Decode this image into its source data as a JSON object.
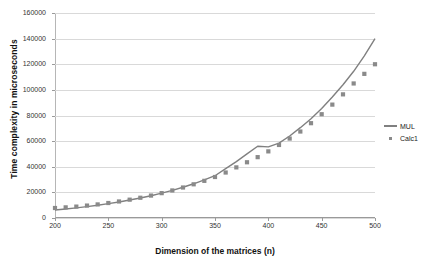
{
  "chart_data": {
    "type": "line",
    "title": "",
    "xlabel": "Dimension of the matrices (n)",
    "ylabel": "Time complexity in microseconds",
    "xlim": [
      200,
      500
    ],
    "ylim": [
      0,
      160000
    ],
    "xticks": [
      200,
      250,
      300,
      350,
      400,
      450,
      500
    ],
    "yticks": [
      0,
      20000,
      40000,
      60000,
      80000,
      100000,
      120000,
      140000,
      160000
    ],
    "grid": "horizontal",
    "legend_position": "right",
    "x": [
      200,
      210,
      220,
      230,
      240,
      250,
      260,
      270,
      280,
      290,
      300,
      310,
      320,
      330,
      340,
      350,
      360,
      370,
      380,
      390,
      400,
      410,
      420,
      430,
      440,
      450,
      460,
      470,
      480,
      490,
      500
    ],
    "series": [
      {
        "name": "MUL",
        "style": "line",
        "color": "#808080",
        "values": [
          6200,
          7000,
          7900,
          8900,
          10000,
          11200,
          12500,
          14000,
          15600,
          17400,
          19400,
          21600,
          24000,
          26700,
          29700,
          33000,
          38500,
          44000,
          50000,
          56000,
          55500,
          58500,
          64000,
          70500,
          77500,
          85500,
          94500,
          104000,
          114500,
          126500,
          140000
        ]
      },
      {
        "name": "Calc1",
        "style": "markers",
        "color": "#8a8a8a",
        "values": [
          7800,
          8300,
          8900,
          9700,
          10600,
          11700,
          12900,
          14300,
          15800,
          17500,
          19400,
          21500,
          23800,
          26300,
          29000,
          32000,
          35500,
          39500,
          43500,
          47500,
          52000,
          57000,
          62000,
          67500,
          74000,
          81000,
          88500,
          96500,
          105000,
          112500,
          120000
        ]
      }
    ]
  },
  "legend": {
    "items": [
      {
        "label": "MUL",
        "key": "line-key"
      },
      {
        "label": "Calc1",
        "key": "square-key"
      }
    ]
  }
}
